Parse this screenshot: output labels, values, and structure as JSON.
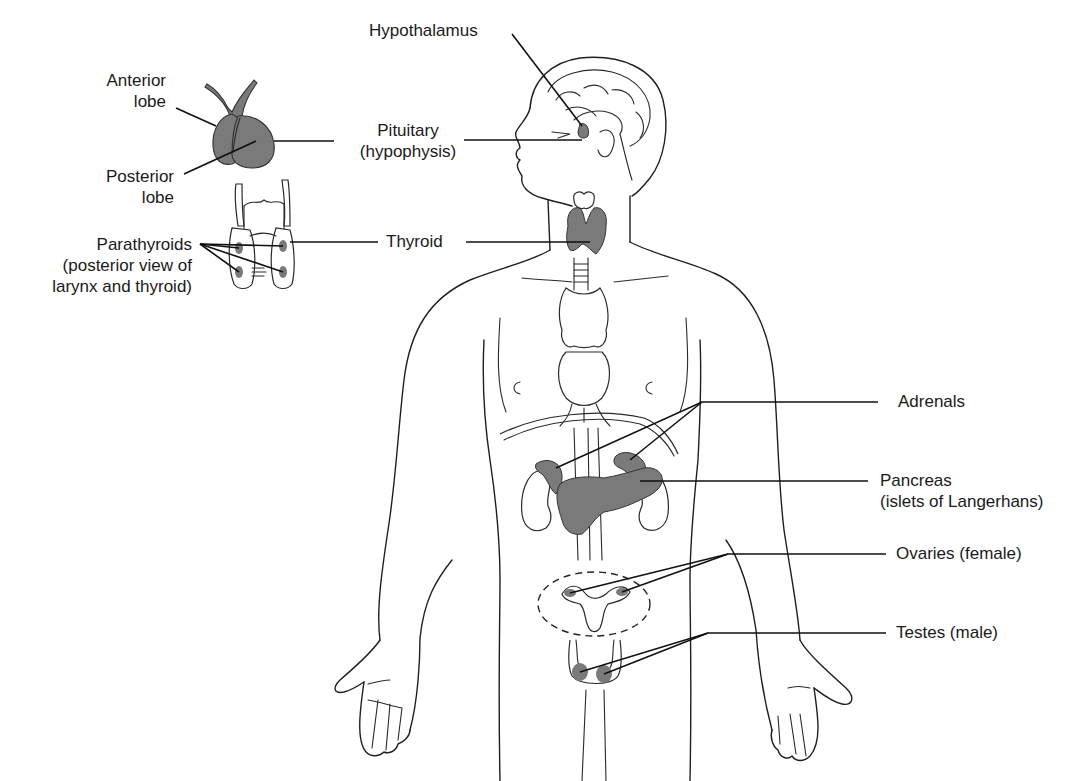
{
  "figure": {
    "gland_fill": "#7a7a7a",
    "line_color": "#1f1f1f",
    "background": "#ffffff"
  },
  "labels": {
    "hypothalamus": {
      "lines": [
        "Hypothalamus"
      ]
    },
    "pituitary": {
      "lines": [
        "Pituitary",
        "(hypophysis)"
      ]
    },
    "anterior_lobe": {
      "lines": [
        "Anterior",
        "lobe"
      ]
    },
    "posterior_lobe": {
      "lines": [
        "Posterior",
        "lobe"
      ]
    },
    "parathyroids": {
      "lines": [
        "Parathyroids",
        "(posterior view of",
        "larynx and thyroid)"
      ]
    },
    "thyroid": {
      "lines": [
        "Thyroid"
      ]
    },
    "adrenals": {
      "lines": [
        "Adrenals"
      ]
    },
    "pancreas": {
      "lines": [
        "Pancreas",
        "(islets of Langerhans)"
      ]
    },
    "ovaries": {
      "lines": [
        "Ovaries (female)"
      ]
    },
    "testes": {
      "lines": [
        "Testes (male)"
      ]
    }
  }
}
